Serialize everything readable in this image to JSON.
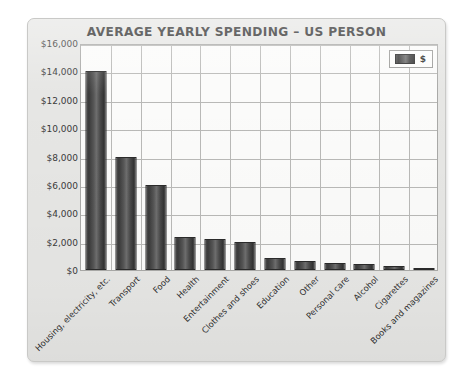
{
  "chart_data": {
    "type": "bar",
    "title": "AVERAGE YEARLY SPENDING – US PERSON",
    "xlabel": "",
    "ylabel": "",
    "ylim": [
      0,
      16000
    ],
    "grid": true,
    "legend_position": "top-right",
    "legend": [
      "$"
    ],
    "ytick_labels": [
      "$16,000",
      "$14,000",
      "$12,000",
      "$10,000",
      "$8,000",
      "$6,000",
      "$4,000",
      "$2,000",
      "$0"
    ],
    "ytick_values": [
      16000,
      14000,
      12000,
      10000,
      8000,
      6000,
      4000,
      2000,
      0
    ],
    "categories": [
      "Housing, electricity, etc.",
      "Transport",
      "Food",
      "Health",
      "Entertainment",
      "Clothes and shoes",
      "Education",
      "Other",
      "Personal care",
      "Alcohol",
      "Cigarettes",
      "Books and magazines"
    ],
    "series": [
      {
        "name": "$",
        "values": [
          14000,
          8000,
          6000,
          2300,
          2200,
          2000,
          850,
          650,
          500,
          400,
          270,
          160
        ]
      }
    ],
    "colors": {
      "bar": "#4a4a4a",
      "bar_edge": "#2b2b2b",
      "plot_background": "#fbfbfa",
      "panel_background": "#e6e6e4",
      "grid": "#b9b9b7",
      "text": "#2a2a2a"
    }
  }
}
